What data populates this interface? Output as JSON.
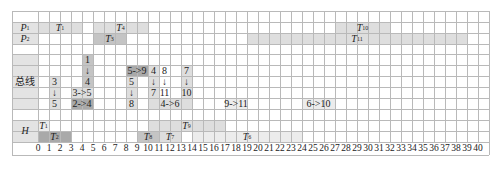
{
  "chart_data": {
    "type": "gantt",
    "title": "",
    "xlabel": "",
    "ylabel": "",
    "xlim": [
      0,
      40
    ],
    "x_ticks": [
      0,
      1,
      2,
      3,
      4,
      5,
      6,
      7,
      8,
      9,
      10,
      11,
      12,
      13,
      14,
      15,
      16,
      17,
      18,
      19,
      20,
      21,
      22,
      23,
      24,
      25,
      26,
      27,
      28,
      29,
      30,
      31,
      32,
      33,
      34,
      35,
      36,
      37,
      38,
      39,
      40
    ],
    "grid": true,
    "lanes": [
      {
        "name": "P1",
        "label_main": "P",
        "label_sub": "1",
        "tasks": [
          {
            "name": "T1",
            "sub": "1",
            "start": 0,
            "end": 4,
            "row": 1,
            "shade": "light"
          },
          {
            "name": "T4",
            "sub": "4",
            "start": 5,
            "end": 10,
            "row": 1,
            "shade": "light"
          },
          {
            "name": "T10",
            "sub": "10",
            "start": 27,
            "end": 32,
            "row": 1,
            "shade": "light"
          }
        ]
      },
      {
        "name": "P2",
        "label_main": "P",
        "label_sub": "2",
        "tasks": [
          {
            "name": "T3",
            "sub": "3",
            "start": 5,
            "end": 8,
            "row": 2,
            "shade": "medium"
          },
          {
            "name": "T11",
            "sub": "11",
            "start": 19,
            "end": 39,
            "row": 2,
            "shade": "light"
          }
        ]
      },
      {
        "name": "总线",
        "transfers": [
          {
            "col": 4,
            "rows": [
              4,
              5,
              6
            ],
            "texts": [
              "1",
              "↓",
              "4"
            ],
            "shade": "medium"
          },
          {
            "col": 1,
            "rows": [
              6,
              7,
              8
            ],
            "texts": [
              "3",
              "↓",
              "5"
            ],
            "shade": "light"
          },
          {
            "start": 3,
            "end": 5,
            "row": 7,
            "text": "3->5",
            "shade": "light"
          },
          {
            "start": 3,
            "end": 5,
            "row": 8,
            "text": "2->4",
            "shade": "dark"
          },
          {
            "start": 8,
            "end": 10,
            "row": 5,
            "text": "5->9",
            "shade": "dark"
          },
          {
            "col": 8,
            "rows": [
              6,
              7,
              8
            ],
            "texts": [
              "5",
              "↓",
              "8"
            ],
            "shade": "light"
          },
          {
            "col": 10,
            "rows": [
              5,
              6,
              7
            ],
            "texts": [
              "4",
              "↓",
              "7"
            ],
            "shade": "light"
          },
          {
            "col": 11,
            "rows": [
              5,
              6,
              7
            ],
            "texts": [
              "8",
              "↓",
              "11"
            ],
            "shade": "none"
          },
          {
            "col": 13,
            "rows": [
              5,
              6,
              7
            ],
            "texts": [
              "7",
              "↓",
              "10"
            ],
            "shade": "light"
          },
          {
            "start": 10,
            "end": 14,
            "row": 8,
            "text": "4->6",
            "shade": "light"
          },
          {
            "start": 17,
            "end": 19,
            "row": 8,
            "text": "9->11",
            "shade": "faint"
          },
          {
            "start": 24,
            "end": 27,
            "row": 8,
            "text": "6->10",
            "shade": "faint"
          }
        ]
      },
      {
        "name": "H",
        "label_main": "H",
        "tasks": [
          {
            "name": "T1",
            "sub": "1",
            "start": 0,
            "end": 1,
            "row": 10,
            "shade": "faint"
          },
          {
            "name": "T9",
            "sub": "9",
            "start": 10,
            "end": 17,
            "row": 10,
            "shade": "light"
          },
          {
            "name": "T2",
            "sub": "2",
            "start": 0,
            "end": 3,
            "row": 11,
            "shade": "dark"
          },
          {
            "name": "T8",
            "sub": "8",
            "start": 9,
            "end": 11,
            "row": 11,
            "shade": "medium"
          },
          {
            "name": "T7",
            "sub": "7",
            "start": 11,
            "end": 13,
            "row": 11,
            "shade": "light"
          },
          {
            "name": "T6",
            "sub": "6",
            "start": 14,
            "end": 24,
            "row": 11,
            "shade": "faint"
          }
        ]
      }
    ]
  },
  "labels": {
    "p1_main": "P",
    "p1_sub": "1",
    "p2_main": "P",
    "p2_sub": "2",
    "bus": "总线",
    "h": "H"
  },
  "colors": {
    "dark": "#a9a9a9",
    "medium": "#c4c4c4",
    "light": "#dedede",
    "faint": "#ececec",
    "label_bg": "#e3e3e3",
    "grid": "#b9b9b9"
  }
}
